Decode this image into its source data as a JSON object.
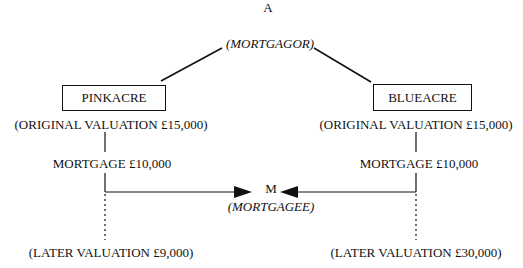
{
  "diagram": {
    "top_party": {
      "label": "A",
      "role": "(MORTGAGOR)"
    },
    "bottom_party": {
      "label": "M",
      "role": "(MORTGAGEE)"
    },
    "properties": [
      {
        "name": "PINKACRE",
        "original_valuation": "(ORIGINAL VALUATION £15,000)",
        "mortgage": "MORTGAGE £10,000",
        "later_valuation": "(LATER VALUATION £9,000)"
      },
      {
        "name": "BLUEACRE",
        "original_valuation": "(ORIGINAL VALUATION £15,000)",
        "mortgage": "MORTGAGE £10,000",
        "later_valuation": "(LATER VALUATION £30,000)"
      }
    ],
    "colors": {
      "ink": "#111111",
      "background": "#ffffff"
    }
  }
}
